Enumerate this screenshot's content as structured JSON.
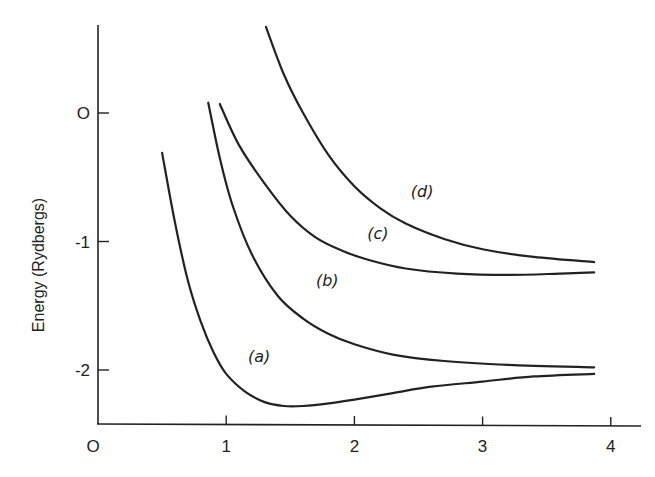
{
  "chart_data": {
    "type": "line",
    "title": "",
    "xlabel": "",
    "ylabel": "Energy (Rydbergs)",
    "xlim": [
      0,
      4.2
    ],
    "ylim": [
      -2.4,
      0.8
    ],
    "grid": false,
    "legend": "none (inline curve labels)",
    "x_ticks": [
      "0",
      "1",
      "2",
      "3",
      "4"
    ],
    "y_ticks": [
      "0",
      "-1",
      "-2"
    ],
    "series": [
      {
        "name": "(a)",
        "label_pos": [
          1.17,
          -1.94
        ],
        "points": [
          [
            0.5,
            -0.31
          ],
          [
            0.6,
            -0.85
          ],
          [
            0.7,
            -1.3
          ],
          [
            0.8,
            -1.62
          ],
          [
            0.9,
            -1.86
          ],
          [
            1.0,
            -2.03
          ],
          [
            1.15,
            -2.17
          ],
          [
            1.3,
            -2.25
          ],
          [
            1.45,
            -2.28
          ],
          [
            1.6,
            -2.28
          ],
          [
            1.8,
            -2.26
          ],
          [
            2.0,
            -2.23
          ],
          [
            2.3,
            -2.18
          ],
          [
            2.6,
            -2.13
          ],
          [
            3.0,
            -2.09
          ],
          [
            3.4,
            -2.05
          ],
          [
            3.87,
            -2.03
          ]
        ]
      },
      {
        "name": "(b)",
        "label_pos": [
          1.7,
          -1.35
        ],
        "points": [
          [
            0.86,
            0.08
          ],
          [
            0.95,
            -0.35
          ],
          [
            1.05,
            -0.72
          ],
          [
            1.2,
            -1.1
          ],
          [
            1.4,
            -1.42
          ],
          [
            1.6,
            -1.6
          ],
          [
            1.8,
            -1.72
          ],
          [
            2.0,
            -1.8
          ],
          [
            2.3,
            -1.88
          ],
          [
            2.7,
            -1.93
          ],
          [
            3.2,
            -1.96
          ],
          [
            3.87,
            -1.98
          ]
        ]
      },
      {
        "name": "(c)",
        "label_pos": [
          2.1,
          -0.98
        ],
        "points": [
          [
            0.95,
            0.07
          ],
          [
            1.1,
            -0.25
          ],
          [
            1.3,
            -0.55
          ],
          [
            1.5,
            -0.8
          ],
          [
            1.7,
            -0.97
          ],
          [
            1.9,
            -1.07
          ],
          [
            2.1,
            -1.14
          ],
          [
            2.4,
            -1.21
          ],
          [
            2.8,
            -1.25
          ],
          [
            3.2,
            -1.26
          ],
          [
            3.6,
            -1.25
          ],
          [
            3.87,
            -1.24
          ]
        ]
      },
      {
        "name": "(d)",
        "label_pos": [
          2.44,
          -0.65
        ],
        "points": [
          [
            1.31,
            0.67
          ],
          [
            1.45,
            0.3
          ],
          [
            1.6,
            0.0
          ],
          [
            1.8,
            -0.33
          ],
          [
            2.0,
            -0.57
          ],
          [
            2.2,
            -0.74
          ],
          [
            2.4,
            -0.86
          ],
          [
            2.7,
            -0.98
          ],
          [
            3.0,
            -1.06
          ],
          [
            3.4,
            -1.12
          ],
          [
            3.87,
            -1.16
          ]
        ]
      }
    ]
  },
  "axis": {
    "ylabel": "Energy (Rydbergs)"
  }
}
